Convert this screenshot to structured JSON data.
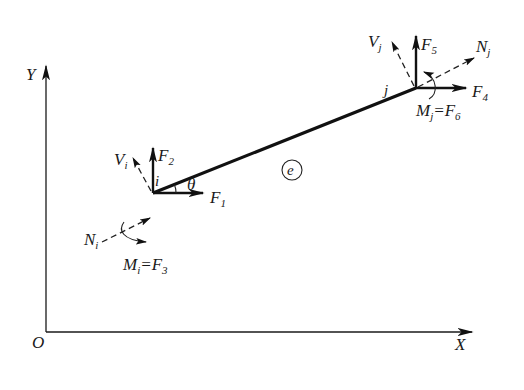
{
  "figure": {
    "axes": {
      "origin_label": "O",
      "x_label": "X",
      "y_label": "Y"
    },
    "element": {
      "label": "e",
      "angle_label": "θ"
    },
    "node_i": {
      "name": "i",
      "forces": {
        "F1": {
          "main": "F",
          "sub": "1"
        },
        "F2": {
          "main": "F",
          "sub": "2"
        }
      },
      "shear": {
        "main": "V",
        "sub": "i"
      },
      "axial": {
        "main": "N",
        "sub": "i"
      },
      "moment": {
        "main": "M",
        "sub": "i",
        "eq": "=F",
        "eq_sub": "3"
      }
    },
    "node_j": {
      "name": "j",
      "forces": {
        "F4": {
          "main": "F",
          "sub": "4"
        },
        "F5": {
          "main": "F",
          "sub": "5"
        }
      },
      "shear": {
        "main": "V",
        "sub": "j"
      },
      "axial": {
        "main": "N",
        "sub": "j"
      },
      "moment": {
        "main": "M",
        "sub": "j",
        "eq": "=F",
        "eq_sub": "6"
      }
    }
  }
}
